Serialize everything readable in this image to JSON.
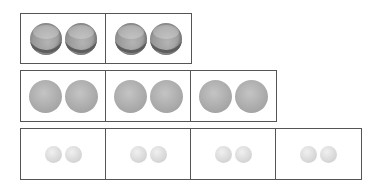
{
  "diagram": {
    "rows": [
      {
        "ball_type": "tennis-ball",
        "boxes": 2,
        "balls_per_box": 2
      },
      {
        "ball_type": "medium-gray-ball",
        "boxes": 3,
        "balls_per_box": 2
      },
      {
        "ball_type": "small-light-ball",
        "boxes": 4,
        "balls_per_box": 2
      }
    ],
    "colors": {
      "border": "#555555",
      "tennis": "#9a9a9a",
      "medium": "#aaaaaa",
      "small": "#d8d8d8"
    }
  }
}
